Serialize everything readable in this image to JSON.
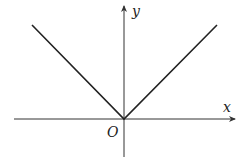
{
  "diagram": {
    "type": "function-graph",
    "function": "y = |x|",
    "axes": {
      "x_label": "x",
      "y_label": "y",
      "origin_label": "O"
    },
    "colors": {
      "axis": "#333333",
      "curve": "#222222",
      "background": "#ffffff"
    }
  }
}
